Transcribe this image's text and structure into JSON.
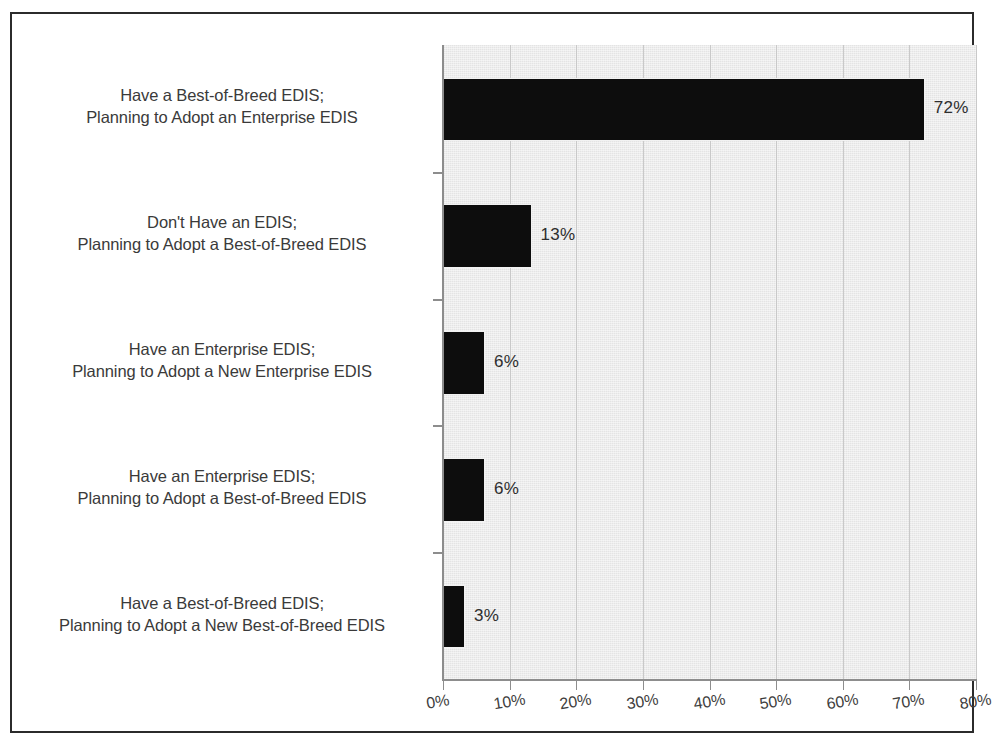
{
  "chart_data": {
    "type": "bar",
    "orientation": "horizontal",
    "title": "",
    "subtitle": "",
    "xlabel": "",
    "ylabel": "",
    "xlim": [
      0,
      80
    ],
    "xtick_labels": [
      "0%",
      "10%",
      "20%",
      "30%",
      "40%",
      "50%",
      "60%",
      "70%",
      "80%"
    ],
    "xtick_values": [
      0,
      10,
      20,
      30,
      40,
      50,
      60,
      70,
      80
    ],
    "grid": true,
    "grid_axis": "x",
    "legend": false,
    "legend_position": "none",
    "bar_color": "#0d0d0d",
    "plot_background": "#e4e4e4",
    "categories": [
      "Have a Best-of-Breed EDIS; Planning to Adopt an Enterprise EDIS",
      "Don't Have an EDIS; Planning to Adopt a Best-of-Breed EDIS",
      "Have an Enterprise EDIS; Planning to Adopt a New Enterprise EDIS",
      "Have an Enterprise EDIS; Planning to Adopt a Best-of-Breed EDIS",
      "Have a Best-of-Breed EDIS; Planning to Adopt a New Best-of-Breed EDIS"
    ],
    "values": [
      72,
      13,
      6,
      6,
      3
    ],
    "data_labels": [
      "72%",
      "13%",
      "6%",
      "6%",
      "3%"
    ]
  },
  "categories": [
    {
      "line1": "Have a Best-of-Breed EDIS;",
      "line2": "Planning to Adopt an Enterprise EDIS",
      "value_label": "72%"
    },
    {
      "line1": "Don't Have an EDIS;",
      "line2": "Planning to Adopt a Best-of-Breed EDIS",
      "value_label": "13%"
    },
    {
      "line1": "Have an Enterprise EDIS;",
      "line2": "Planning to Adopt a New Enterprise EDIS",
      "value_label": "6%"
    },
    {
      "line1": "Have an Enterprise EDIS;",
      "line2": "Planning to Adopt a Best-of-Breed EDIS",
      "value_label": "6%"
    },
    {
      "line1": "Have a Best-of-Breed EDIS;",
      "line2": "Planning to Adopt a New Best-of-Breed EDIS",
      "value_label": "3%"
    }
  ],
  "axis": {
    "ticks": [
      {
        "label": "0%"
      },
      {
        "label": "10%"
      },
      {
        "label": "20%"
      },
      {
        "label": "30%"
      },
      {
        "label": "40%"
      },
      {
        "label": "50%"
      },
      {
        "label": "60%"
      },
      {
        "label": "70%"
      },
      {
        "label": "80%"
      }
    ]
  }
}
